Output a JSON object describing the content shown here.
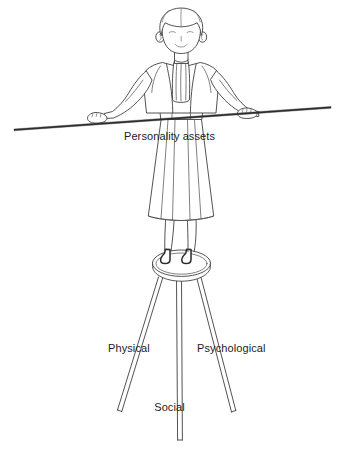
{
  "illustration": {
    "title": "Personality assets balance illustration",
    "subject": "woman-balancing-on-three-legged-stool",
    "style": "line-art",
    "background_color": "#ffffff",
    "line_color": "#3f3f3f",
    "text_color": "#1d1d1d"
  },
  "labels": {
    "pole": "Personality assets",
    "leg_left": "Physical",
    "leg_right": "Psychological",
    "leg_center": "Social"
  }
}
